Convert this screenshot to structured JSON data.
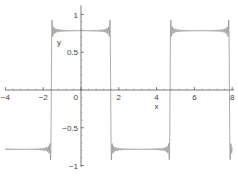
{
  "chart_data": {
    "type": "line",
    "title": "",
    "xlabel": "x",
    "ylabel": "y",
    "xlim": [
      -4,
      8
    ],
    "ylim": [
      -1.0,
      1.1
    ],
    "grid": false,
    "legend": null,
    "x_ticks": [
      -4,
      -2,
      0,
      2,
      4,
      6,
      8
    ],
    "x_tick_labels": [
      "-4",
      "-2",
      "0",
      "2",
      "4",
      "6",
      "8"
    ],
    "y_ticks": [
      -1,
      -0.5,
      0.5,
      1
    ],
    "y_tick_labels": [
      "-1",
      "-0.5",
      "0.5",
      "1"
    ],
    "series": [
      {
        "name": "Fourier partial sum (square wave, Gibbs phenomenon)",
        "color": "#888888",
        "description": "Square wave of amplitude pi/4 with period 2*pi; jumps at x = -pi/2, pi/2, 3pi/2, 5pi/2 with Gibbs overshoot ripples near each discontinuity",
        "levels": {
          "high": 0.785,
          "low": -0.785
        },
        "segments": [
          {
            "x_start": -4.0,
            "x_end": -1.571,
            "y": -0.785
          },
          {
            "x_start": -1.571,
            "x_end": 1.571,
            "y": 0.785
          },
          {
            "x_start": 1.571,
            "x_end": 4.712,
            "y": -0.785
          },
          {
            "x_start": 4.712,
            "x_end": 7.854,
            "y": 0.785
          },
          {
            "x_start": 7.854,
            "x_end": 8.0,
            "y": -0.785
          }
        ],
        "overshoot_peak": 0.92,
        "harmonics": 40
      }
    ]
  }
}
